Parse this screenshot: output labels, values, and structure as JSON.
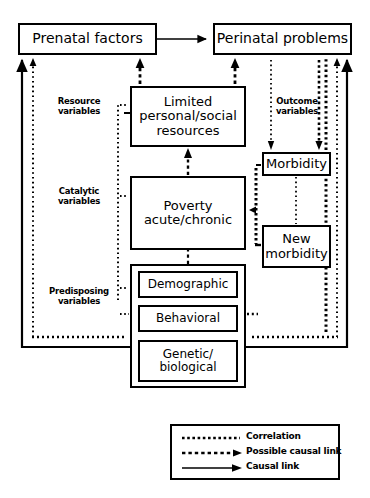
{
  "diagram": {
    "nodes": {
      "prenatal": "Prenatal factors",
      "perinatal": "Perinatal problems",
      "resources": "Limited\npersonal/social\nresources",
      "poverty": "Poverty\nacute/chronic",
      "morbidity": "Morbidity",
      "new_morbidity": "New\nmorbidity",
      "demographic": "Demographic",
      "behavioral": "Behavioral",
      "genetic": "Genetic/\nbiological"
    },
    "side_labels": {
      "resource": "Resource\nvariables",
      "catalytic": "Catalytic\nvariables",
      "predisposing": "Predisposing\nvariables",
      "outcome": "Outcome\nvariables"
    },
    "legend": {
      "items": [
        {
          "label": "Correlation",
          "style": "dotted",
          "arrow": false
        },
        {
          "label": "Possible causal link",
          "style": "dashed",
          "arrow": true
        },
        {
          "label": "Causal link",
          "style": "solid",
          "arrow": true
        }
      ]
    },
    "colors": {
      "stroke": "#000000",
      "background": "#ffffff"
    }
  }
}
